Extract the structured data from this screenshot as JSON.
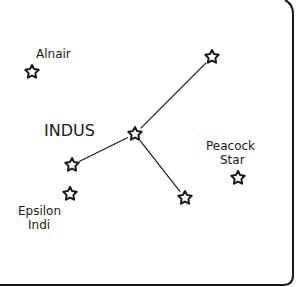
{
  "title": "INDUS",
  "stars": [
    {
      "id": "alnair",
      "label": "Alnair"
    },
    {
      "id": "indus-top",
      "label": ""
    },
    {
      "id": "indus-center",
      "label": ""
    },
    {
      "id": "indus-left",
      "label": ""
    },
    {
      "id": "epsilon-indi",
      "label": "Epsilon Indi"
    },
    {
      "id": "indus-lower",
      "label": ""
    },
    {
      "id": "peacock",
      "label": "Peacock Star"
    }
  ],
  "labels": {
    "constellation": "INDUS",
    "alnair": "Alnair",
    "peacock_line1": "Peacock",
    "peacock_line2": "Star",
    "epsilon_line1": "Epsilon",
    "epsilon_line2": "Indi"
  },
  "connections": [
    [
      "indus-center",
      "indus-top"
    ],
    [
      "indus-center",
      "indus-left"
    ],
    [
      "indus-center",
      "indus-lower"
    ]
  ],
  "colors": {
    "ink": "#1a1a1a",
    "background": "#ffffff"
  }
}
